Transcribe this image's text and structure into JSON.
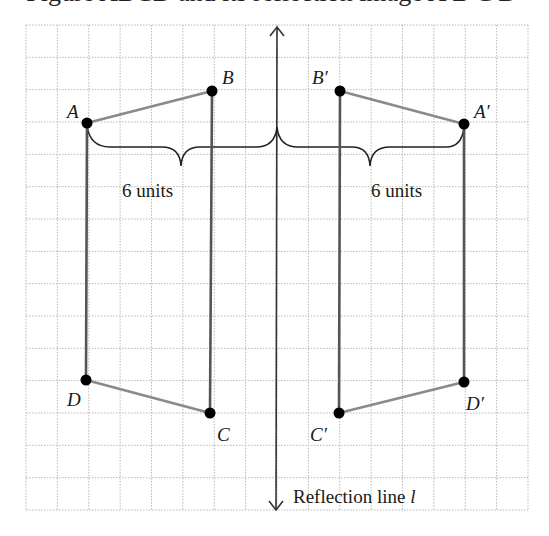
{
  "title": "Figure ABCD and its reflection image A′B′C′D′",
  "grid": {
    "left": 26,
    "top": 25,
    "right": 528,
    "bottom": 510,
    "cols": 16,
    "rows": 15,
    "line_color": "#b8b8b8"
  },
  "colors": {
    "vertical_edge": "#555555",
    "slanted_edge": "#8a8a8a",
    "point": "#000000",
    "reflection_line": "#333333",
    "brace": "#222222"
  },
  "reflection_line": {
    "x": 277,
    "y_top": 27,
    "y_bottom": 510,
    "label": "Reflection line l",
    "label_main": "Reflection line ",
    "label_var": "l"
  },
  "points": {
    "A": {
      "label": "A",
      "x": 87,
      "y": 123
    },
    "B": {
      "label": "B",
      "x": 212,
      "y": 91
    },
    "C": {
      "label": "C",
      "x": 210,
      "y": 413
    },
    "D": {
      "label": "D",
      "x": 86,
      "y": 380
    },
    "A2": {
      "label": "A′",
      "x": 464,
      "y": 124
    },
    "B2": {
      "label": "B′",
      "x": 340,
      "y": 91
    },
    "C2": {
      "label": "C′",
      "x": 339,
      "y": 413
    },
    "D2": {
      "label": "D′",
      "x": 464,
      "y": 382
    }
  },
  "braces": [
    {
      "label": "6 units",
      "from": "A",
      "to": "line"
    },
    {
      "label": "6 units",
      "from": "line",
      "to": "A′"
    }
  ]
}
